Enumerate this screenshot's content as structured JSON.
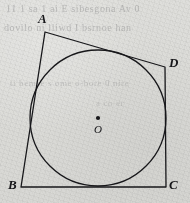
{
  "figure": {
    "kind": "tangential-quadrilateral-with-inscribed-circle",
    "background_color": "#ededeb",
    "ink_color": "#17171a",
    "labels": {
      "vertex_a": "A",
      "vertex_b": "B",
      "vertex_c": "C",
      "vertex_d": "D",
      "center": "O"
    },
    "points": {
      "A": {
        "x": 45,
        "y": 32
      },
      "B": {
        "x": 21,
        "y": 187
      },
      "C": {
        "x": 166,
        "y": 187
      },
      "D": {
        "x": 165,
        "y": 67
      },
      "O": {
        "x": 98,
        "y": 118
      }
    },
    "circle": {
      "cx": 98,
      "cy": 118,
      "r": 68
    },
    "stroke_width": 1.3,
    "center_dot_radius": 2.1
  },
  "bleed_text": {
    "line_1": "11   1 sa 1 ai E sibesgona  Av 0",
    "line_2": "dovilo  ni   lliwd  I bsrnoe han",
    "line_3": "ti bemse  s ome  o-bore  0 nire",
    "line_4": "a co er"
  }
}
